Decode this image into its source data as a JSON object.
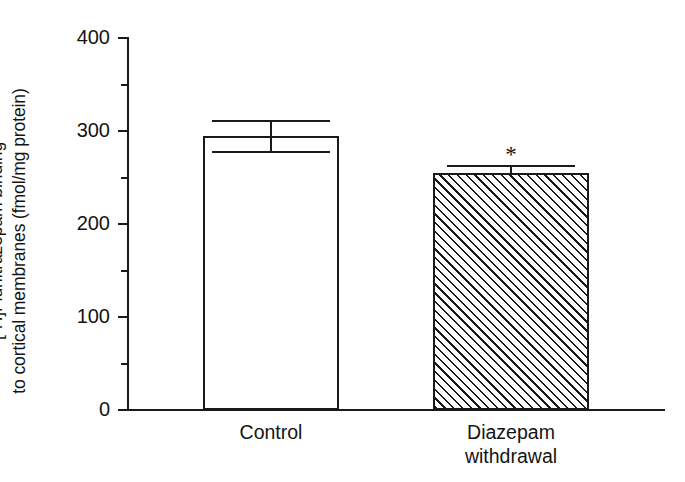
{
  "figure": {
    "background_color": "#ffffff",
    "ink_color": "#1a1a1a"
  },
  "axis": {
    "y_label_line1": "[3H]Flunitrazepam binding",
    "y_label_line2": "to cortical membranes (fmol/mg protein)",
    "y_label_prefix": "[",
    "y_label_superscript": "3",
    "y_label_rest": "H]Flunitrazepam binding",
    "y_tick_labels": [
      "400",
      "300",
      "200",
      "100",
      "0"
    ],
    "y_minor_values": [
      350,
      250,
      150,
      50
    ]
  },
  "annotations": {
    "significance_marker": "*"
  },
  "chart_data": {
    "type": "bar",
    "title": "",
    "xlabel": "",
    "ylabel": "[3H]Flunitrazepam binding to cortical membranes (fmol/mg protein)",
    "categories": [
      "Control",
      "Diazepam\nwithdrawal"
    ],
    "values": [
      295,
      255
    ],
    "errors_upper": [
      17,
      8
    ],
    "errors_lower": [
      17,
      0
    ],
    "bar_styles": [
      "open",
      "hatched"
    ],
    "annotations": [
      "",
      "*"
    ],
    "ylim": [
      0,
      400
    ],
    "y_major_ticks": [
      0,
      100,
      200,
      300,
      400
    ],
    "y_minor_ticks": [
      50,
      150,
      250,
      350
    ],
    "grid": false,
    "legend": "none",
    "units": "fmol/mg protein"
  }
}
